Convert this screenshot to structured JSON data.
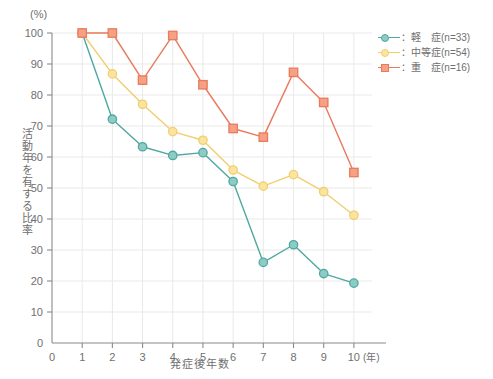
{
  "chart_data": {
    "type": "line",
    "title": "",
    "unit_label": "(%)",
    "xlabel": "発症後年数",
    "xlabel_unit": "(年)",
    "ylabel": "活動年を有する比率",
    "x": [
      1,
      2,
      3,
      4,
      5,
      6,
      7,
      8,
      9,
      10
    ],
    "xlim": [
      0,
      10.6
    ],
    "ylim": [
      0,
      100
    ],
    "y_ticks": [
      0,
      10,
      20,
      30,
      40,
      50,
      60,
      70,
      80,
      90,
      100
    ],
    "x_ticks": [
      0,
      1,
      2,
      3,
      4,
      5,
      6,
      7,
      8,
      9,
      10
    ],
    "grid": true,
    "legend_position": "right-top",
    "series": [
      {
        "name": "：軽　症(n=33)",
        "label_prefix": "：",
        "values": [
          100,
          72.2,
          63.3,
          60.5,
          61.4,
          52.1,
          26.0,
          31.7,
          22.4,
          19.3
        ],
        "color": "#4fa8a0",
        "marker": "circle",
        "marker_fill": "#8ecbc5"
      },
      {
        "name": "：中等症(n=54)",
        "label_prefix": "：",
        "values": [
          100,
          86.8,
          77.0,
          68.2,
          65.4,
          55.8,
          50.6,
          54.3,
          48.8,
          41.2
        ],
        "color": "#f0cf6e",
        "marker": "circle",
        "marker_fill": "#fae4a0"
      },
      {
        "name": "：重　症(n=16)",
        "label_prefix": "：",
        "values": [
          100,
          100,
          84.8,
          99.2,
          83.3,
          69.2,
          66.4,
          87.3,
          77.6,
          55.0
        ],
        "color": "#e87a5e",
        "marker": "square",
        "marker_fill": "#f6a183"
      }
    ]
  },
  "legend": {
    "items": [
      {
        "label": "：軽　症(n=33)",
        "color": "#4fa8a0",
        "fill": "#8ecbc5",
        "marker": "circle"
      },
      {
        "label": "：中等症(n=54)",
        "color": "#f0cf6e",
        "fill": "#fae4a0",
        "marker": "circle"
      },
      {
        "label": "：重　症(n=16)",
        "color": "#e87a5e",
        "fill": "#f6a183",
        "marker": "square"
      }
    ]
  }
}
